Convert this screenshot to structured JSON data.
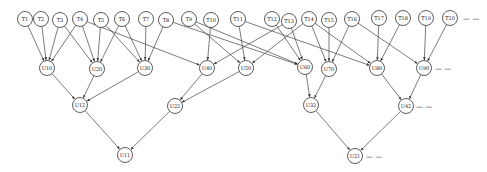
{
  "diagram": {
    "title": "",
    "node_radius": 7.5,
    "nodes": [
      {
        "id": "T1",
        "label": "T1",
        "x": 25,
        "y": 19
      },
      {
        "id": "T2",
        "label": "T2",
        "x": 41,
        "y": 19
      },
      {
        "id": "T3",
        "label": "T3",
        "x": 60,
        "y": 20
      },
      {
        "id": "T4",
        "label": "T4",
        "x": 80,
        "y": 19
      },
      {
        "id": "T5",
        "label": "T5",
        "x": 101,
        "y": 20
      },
      {
        "id": "T6",
        "label": "T6",
        "x": 122,
        "y": 19
      },
      {
        "id": "T7",
        "label": "T7",
        "x": 146,
        "y": 19
      },
      {
        "id": "T8",
        "label": "T8",
        "x": 166,
        "y": 20
      },
      {
        "id": "T9",
        "label": "T9",
        "x": 189,
        "y": 19
      },
      {
        "id": "T10",
        "label": "T10",
        "x": 211,
        "y": 20
      },
      {
        "id": "T11",
        "label": "T11",
        "x": 238,
        "y": 19
      },
      {
        "id": "T12",
        "label": "T12",
        "x": 272,
        "y": 19
      },
      {
        "id": "T13",
        "label": "T13",
        "x": 289,
        "y": 21
      },
      {
        "id": "T14",
        "label": "T14",
        "x": 309,
        "y": 19
      },
      {
        "id": "T15",
        "label": "T15",
        "x": 329,
        "y": 20
      },
      {
        "id": "T16",
        "label": "T16",
        "x": 352,
        "y": 19
      },
      {
        "id": "T17",
        "label": "T17",
        "x": 379,
        "y": 18
      },
      {
        "id": "T18",
        "label": "T18",
        "x": 403,
        "y": 18
      },
      {
        "id": "T19",
        "label": "T19",
        "x": 426,
        "y": 18
      },
      {
        "id": "T20",
        "label": "T20",
        "x": 450,
        "y": 18
      },
      {
        "id": "U10",
        "label": "U10",
        "x": 47,
        "y": 68
      },
      {
        "id": "U20",
        "label": "U20",
        "x": 97,
        "y": 69
      },
      {
        "id": "U30",
        "label": "U30",
        "x": 145,
        "y": 68
      },
      {
        "id": "U40",
        "label": "U40",
        "x": 207,
        "y": 68
      },
      {
        "id": "U50",
        "label": "U50",
        "x": 246,
        "y": 68
      },
      {
        "id": "U60",
        "label": "U60",
        "x": 305,
        "y": 67
      },
      {
        "id": "U70",
        "label": "U70",
        "x": 329,
        "y": 69
      },
      {
        "id": "U80",
        "label": "U80",
        "x": 377,
        "y": 68
      },
      {
        "id": "U90",
        "label": "U90",
        "x": 424,
        "y": 68
      },
      {
        "id": "U12",
        "label": "U12",
        "x": 80,
        "y": 105
      },
      {
        "id": "U22",
        "label": "U22",
        "x": 175,
        "y": 106
      },
      {
        "id": "U32",
        "label": "U32",
        "x": 311,
        "y": 105
      },
      {
        "id": "U42",
        "label": "U42",
        "x": 406,
        "y": 106
      },
      {
        "id": "U11",
        "label": "U11",
        "x": 125,
        "y": 155
      },
      {
        "id": "U21",
        "label": "U21",
        "x": 355,
        "y": 156
      }
    ],
    "edges": [
      [
        "T1",
        "U10"
      ],
      [
        "T2",
        "U10"
      ],
      [
        "T3",
        "U10"
      ],
      [
        "T4",
        "U10"
      ],
      [
        "T3",
        "U20"
      ],
      [
        "T4",
        "U20"
      ],
      [
        "T5",
        "U20"
      ],
      [
        "T6",
        "U20"
      ],
      [
        "T4",
        "U40"
      ],
      [
        "T5",
        "U30"
      ],
      [
        "T6",
        "U30"
      ],
      [
        "T7",
        "U30"
      ],
      [
        "T8",
        "U30"
      ],
      [
        "T8",
        "U60"
      ],
      [
        "T9",
        "U50"
      ],
      [
        "T10",
        "U40"
      ],
      [
        "T11",
        "U50"
      ],
      [
        "T9",
        "U60"
      ],
      [
        "T12",
        "U60"
      ],
      [
        "T13",
        "U60"
      ],
      [
        "T13",
        "U40"
      ],
      [
        "T14",
        "U50"
      ],
      [
        "T11",
        "U80"
      ],
      [
        "T14",
        "U70"
      ],
      [
        "T15",
        "U70"
      ],
      [
        "T16",
        "U70"
      ],
      [
        "T14",
        "U80"
      ],
      [
        "T17",
        "U80"
      ],
      [
        "T18",
        "U80"
      ],
      [
        "T16",
        "U90"
      ],
      [
        "T19",
        "U90"
      ],
      [
        "T20",
        "U90"
      ],
      [
        "U10",
        "U12"
      ],
      [
        "U20",
        "U12"
      ],
      [
        "U30",
        "U12"
      ],
      [
        "U40",
        "U22"
      ],
      [
        "U50",
        "U22"
      ],
      [
        "U60",
        "U32"
      ],
      [
        "U70",
        "U32"
      ],
      [
        "U80",
        "U42"
      ],
      [
        "U90",
        "U42"
      ],
      [
        "U12",
        "U11"
      ],
      [
        "U22",
        "U11"
      ],
      [
        "U32",
        "U21"
      ],
      [
        "U42",
        "U21"
      ]
    ],
    "ellipses": [
      {
        "after": "T20",
        "text": "— —",
        "x": 463,
        "y": 19
      },
      {
        "after": "U90",
        "text": "— —",
        "x": 435,
        "y": 69
      },
      {
        "after": "U42",
        "text": "— —",
        "x": 416,
        "y": 107
      },
      {
        "after": "U21",
        "text": "— —",
        "x": 366,
        "y": 157
      }
    ]
  }
}
